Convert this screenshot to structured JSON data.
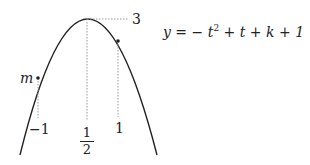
{
  "diagram": {
    "equation": "y = −t² + t + k + 1",
    "equation_parts": {
      "lhs": "y",
      "eq": " = ",
      "rhs_prefix": " − ",
      "t": "t",
      "sup": "2",
      "rest": " + t + k + 1"
    },
    "vertex_value_label": "3",
    "point_label": "m",
    "x_labels": {
      "neg_one": "−1",
      "half_num": "1",
      "half_den": "2",
      "one": "1"
    },
    "curve_color": "#222222",
    "dotted_color": "#999999"
  }
}
